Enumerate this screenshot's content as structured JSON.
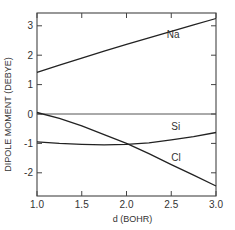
{
  "chart_data": {
    "type": "line",
    "title": "",
    "xlabel": "d (BOHR)",
    "ylabel": "DIPOLE MOMENT (DEBYE)",
    "xlim": [
      1.0,
      3.0
    ],
    "ylim": [
      -2.8,
      3.4
    ],
    "x_ticks": [
      1.0,
      1.5,
      2.0,
      2.5,
      3.0
    ],
    "x_tick_labels": [
      "1.0",
      "1.5",
      "2.0",
      "2.5",
      "3.0"
    ],
    "y_ticks": [
      -2,
      -1,
      0,
      1,
      2,
      3
    ],
    "y_tick_labels": [
      "-2",
      "-1",
      "0",
      "1",
      "2",
      "3"
    ],
    "grid": false,
    "legend": "inline labels",
    "reference_line": {
      "y": 0
    },
    "x": [
      1.0,
      1.25,
      1.5,
      1.75,
      2.0,
      2.25,
      2.5,
      2.75,
      3.0
    ],
    "series": [
      {
        "name": "Na",
        "label_at": [
          2.45,
          2.6
        ],
        "values": [
          1.42,
          1.66,
          1.9,
          2.14,
          2.37,
          2.59,
          2.81,
          3.03,
          3.25
        ]
      },
      {
        "name": "Si",
        "label_at": [
          2.5,
          -0.55
        ],
        "values": [
          -0.95,
          -1.0,
          -1.03,
          -1.05,
          -1.03,
          -0.98,
          -0.88,
          -0.77,
          -0.63
        ]
      },
      {
        "name": "Cl",
        "label_at": [
          2.5,
          -1.6
        ],
        "values": [
          0.05,
          -0.15,
          -0.4,
          -0.7,
          -1.0,
          -1.35,
          -1.72,
          -2.08,
          -2.45
        ]
      }
    ]
  }
}
